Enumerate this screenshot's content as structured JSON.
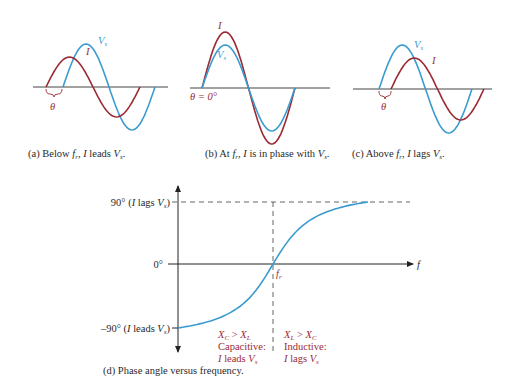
{
  "colors": {
    "current_wave": "#9b2a35",
    "voltage_wave": "#3a9bd0",
    "axis": "#333333",
    "region_text": "#9b2a35",
    "curve": "#3a9bd0"
  },
  "panels": [
    {
      "id": "a",
      "caption_prefix": "(a) Below ",
      "caption_sym": "f",
      "caption_sub": "r",
      "caption_mid": ", ",
      "caption_I": "I",
      "caption_rest": " leads ",
      "caption_V": "V",
      "caption_Vsub": "s",
      "caption_end": ".",
      "label_I": "I",
      "label_V": "V",
      "label_V_sub": "s",
      "theta_label": "θ"
    },
    {
      "id": "b",
      "caption_prefix": "(b) At ",
      "caption_sym": "f",
      "caption_sub": "r",
      "caption_mid": ", ",
      "caption_I": "I",
      "caption_rest": " is in phase with ",
      "caption_V": "V",
      "caption_Vsub": "s",
      "caption_end": ".",
      "label_I": "I",
      "label_V": "V",
      "label_V_sub": "s",
      "theta_label": "θ = 0°"
    },
    {
      "id": "c",
      "caption_prefix": "(c) Above ",
      "caption_sym": "f",
      "caption_sub": "r",
      "caption_mid": ", ",
      "caption_I": "I",
      "caption_rest": " lags ",
      "caption_V": "V",
      "caption_Vsub": "s",
      "caption_end": ".",
      "label_I": "I",
      "label_V": "V",
      "label_V_sub": "s",
      "theta_label": "θ"
    }
  ],
  "phase_plot": {
    "caption": "(d) Phase angle versus frequency.",
    "y_top_label": "90° (",
    "y_top_I": "I",
    "y_top_mid": " lags ",
    "y_top_V": "V",
    "y_top_Vsub": "s",
    "y_top_end": ")",
    "y_zero_label": "0°",
    "y_bottom_label": "–90° (",
    "y_bottom_I": "I",
    "y_bottom_mid": " leads ",
    "y_bottom_V": "V",
    "y_bottom_Vsub": "s",
    "y_bottom_end": ")",
    "x_axis_label": "f",
    "fr_label": "f",
    "fr_sub": "r",
    "left_region": {
      "line1_X1": "X",
      "line1_X1sub": "C",
      "line1_op": " > ",
      "line1_X2": "X",
      "line1_X2sub": "L",
      "line2": "Capacitive:",
      "line3_I": "I",
      "line3_rest": " leads ",
      "line3_V": "V",
      "line3_Vsub": "s"
    },
    "right_region": {
      "line1_X1": "X",
      "line1_X1sub": "L",
      "line1_op": " > ",
      "line1_X2": "X",
      "line1_X2sub": "C",
      "line2": "Inductive:",
      "line3_I": "I",
      "line3_rest": " lags ",
      "line3_V": "V",
      "line3_Vsub": "s"
    }
  },
  "chart_data": {
    "type": "line",
    "title": "Phase angle versus frequency",
    "xlabel": "f",
    "ylabel": "Phase angle θ",
    "yticks": [
      "–90° (I leads Vs)",
      "0°",
      "90° (I lags Vs)"
    ],
    "ylim": [
      -90,
      90
    ],
    "x_marker": "fr",
    "series": [
      {
        "name": "phase angle",
        "x_relative_to_fr": [
          0.0,
          0.25,
          0.5,
          0.75,
          1.0,
          1.25,
          1.5,
          1.75,
          2.0
        ],
        "values": [
          -90,
          -85,
          -70,
          -40,
          0,
          40,
          70,
          85,
          90
        ]
      }
    ],
    "regions": [
      {
        "range": "f < fr",
        "label": "XC > XL, Capacitive: I leads Vs"
      },
      {
        "range": "f > fr",
        "label": "XL > XC, Inductive: I lags Vs"
      }
    ],
    "waveform_panels": [
      {
        "panel": "a",
        "condition": "Below fr",
        "relation": "I leads Vs",
        "current_amplitude_rel": 0.7,
        "voltage_amplitude_rel": 1.0,
        "phase_deg": 45
      },
      {
        "panel": "b",
        "condition": "At fr",
        "relation": "I in phase with Vs",
        "current_amplitude_rel": 1.25,
        "voltage_amplitude_rel": 1.0,
        "phase_deg": 0
      },
      {
        "panel": "c",
        "condition": "Above fr",
        "relation": "I lags Vs",
        "current_amplitude_rel": 0.7,
        "voltage_amplitude_rel": 1.0,
        "phase_deg": -45
      }
    ],
    "grid": false,
    "legend": "none"
  }
}
